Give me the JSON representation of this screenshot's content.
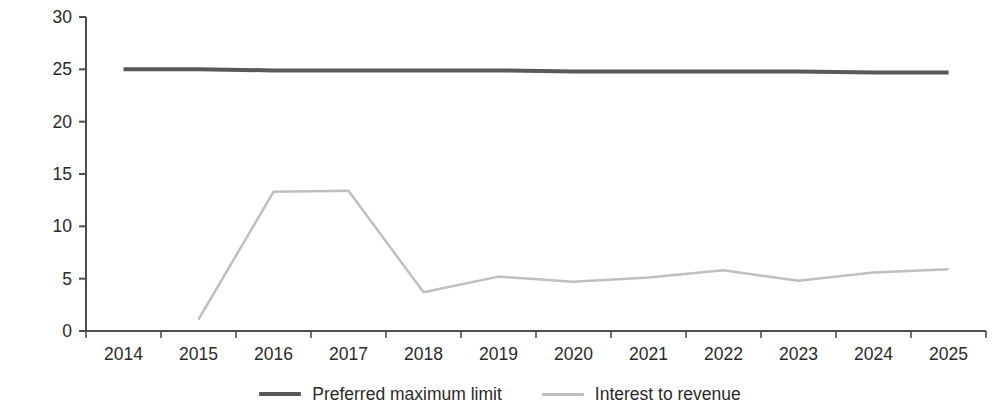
{
  "chart_data": {
    "type": "line",
    "title": "",
    "xlabel": "",
    "ylabel": "Debt service to revenue, %",
    "categories": [
      "2014",
      "2015",
      "2016",
      "2017",
      "2018",
      "2019",
      "2020",
      "2021",
      "2022",
      "2023",
      "2024",
      "2025"
    ],
    "ylim": [
      0,
      30
    ],
    "yticks": [
      0,
      5,
      10,
      15,
      20,
      25,
      30
    ],
    "ytick_labels": [
      "0",
      "5",
      "10",
      "15",
      "20",
      "25",
      "30"
    ],
    "grid": false,
    "legend_position": "bottom",
    "series": [
      {
        "name": "Preferred maximum limit",
        "color": "#595959",
        "linewidth": 4,
        "values": [
          25.0,
          25.0,
          24.9,
          24.9,
          24.9,
          24.9,
          24.8,
          24.8,
          24.8,
          24.8,
          24.7,
          24.7
        ]
      },
      {
        "name": "Interest to revenue",
        "color": "#bfbfbf",
        "linewidth": 2.5,
        "values": [
          null,
          1.1,
          13.3,
          13.4,
          3.7,
          5.2,
          4.7,
          5.1,
          5.8,
          4.8,
          5.6,
          5.9
        ]
      }
    ]
  },
  "axes": {
    "y_axis_title": "Debt service to revenue, %",
    "y_tick_labels": [
      "30",
      "25",
      "20",
      "15",
      "10",
      "5",
      "0"
    ],
    "x_tick_labels": [
      "2014",
      "2015",
      "2016",
      "2017",
      "2018",
      "2019",
      "2020",
      "2021",
      "2022",
      "2023",
      "2024",
      "2025"
    ],
    "axis_color": "#4d4d4d"
  },
  "legend": {
    "items": [
      {
        "label": "Preferred maximum limit",
        "color": "#595959"
      },
      {
        "label": "Interest to revenue",
        "color": "#bfbfbf"
      }
    ]
  }
}
